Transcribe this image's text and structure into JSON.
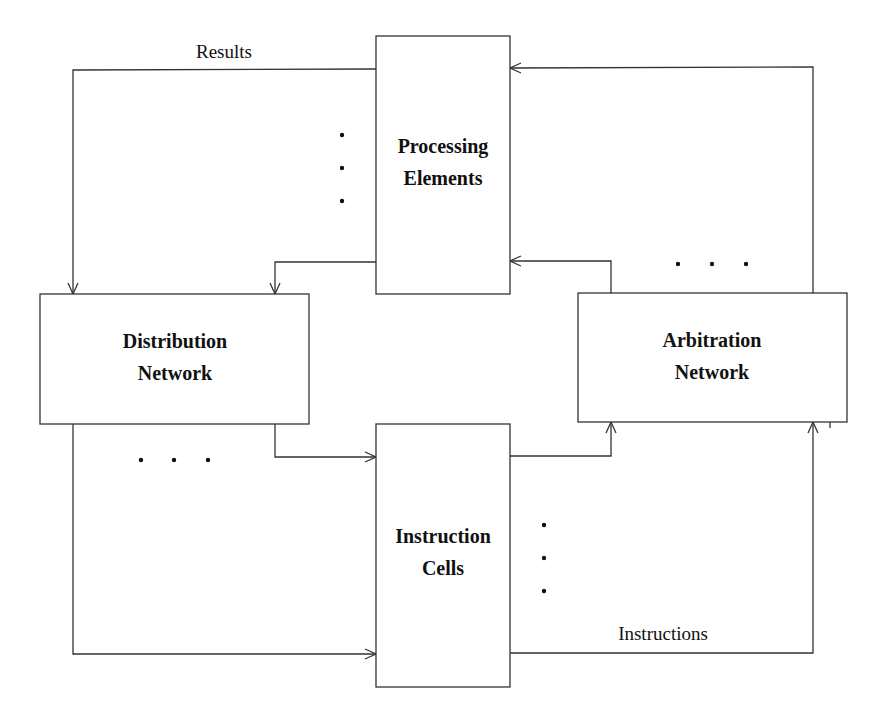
{
  "diagram": {
    "type": "block-diagram",
    "blocks": {
      "processing_elements": {
        "line1": "Processing",
        "line2": "Elements"
      },
      "distribution_network": {
        "line1": "Distribution",
        "line2": "Network"
      },
      "arbitration_network": {
        "line1": "Arbitration",
        "line2": "Network"
      },
      "instruction_cells": {
        "line1": "Instruction",
        "line2": "Cells"
      }
    },
    "edge_labels": {
      "results": "Results",
      "instructions": "Instructions"
    },
    "connections": [
      {
        "from": "Processing Elements",
        "to": "Distribution Network",
        "label": "Results"
      },
      {
        "from": "Processing Elements",
        "to": "Distribution Network",
        "label": ""
      },
      {
        "from": "Distribution Network",
        "to": "Instruction Cells",
        "label": ""
      },
      {
        "from": "Distribution Network",
        "to": "Instruction Cells",
        "label": ""
      },
      {
        "from": "Instruction Cells",
        "to": "Arbitration Network",
        "label": ""
      },
      {
        "from": "Instruction Cells",
        "to": "Arbitration Network",
        "label": "Instructions"
      },
      {
        "from": "Arbitration Network",
        "to": "Processing Elements",
        "label": ""
      },
      {
        "from": "Arbitration Network",
        "to": "Processing Elements",
        "label": ""
      }
    ],
    "ellipsis_markers": [
      "processing-elements-ellipsis",
      "distribution-ellipsis",
      "arbitration-ellipsis",
      "instruction-cells-ellipsis"
    ]
  }
}
